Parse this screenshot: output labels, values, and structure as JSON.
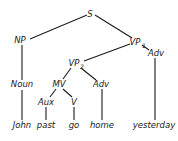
{
  "tree": {
    "nodes": {
      "S": {
        "label": "S",
        "sub": ""
      },
      "NP": {
        "label": "NP",
        "sub": ""
      },
      "VP1": {
        "label": "VP",
        "sub": "1"
      },
      "AdvTop": {
        "label": "Adv",
        "sub": ""
      },
      "VP2": {
        "label": "VP",
        "sub": "2"
      },
      "Noun": {
        "label": "Noun",
        "sub": ""
      },
      "MV": {
        "label": "MV",
        "sub": ""
      },
      "AdvMid": {
        "label": "Adv",
        "sub": ""
      },
      "Aux": {
        "label": "Aux",
        "sub": ""
      },
      "V": {
        "label": "V",
        "sub": ""
      },
      "John": {
        "label": "John",
        "sub": ""
      },
      "past": {
        "label": "past",
        "sub": ""
      },
      "go": {
        "label": "go",
        "sub": ""
      },
      "home": {
        "label": "home",
        "sub": ""
      },
      "yesterday": {
        "label": "yesterday",
        "sub": ""
      }
    },
    "edges": [
      [
        "S",
        "NP"
      ],
      [
        "S",
        "VP1"
      ],
      [
        "NP",
        "Noun"
      ],
      [
        "Noun",
        "John"
      ],
      [
        "VP1",
        "VP2"
      ],
      [
        "VP1",
        "AdvTop"
      ],
      [
        "AdvTop",
        "yesterday"
      ],
      [
        "VP2",
        "MV"
      ],
      [
        "VP2",
        "AdvMid"
      ],
      [
        "MV",
        "Aux"
      ],
      [
        "MV",
        "V"
      ],
      [
        "Aux",
        "past"
      ],
      [
        "V",
        "go"
      ],
      [
        "AdvMid",
        "home"
      ]
    ]
  }
}
